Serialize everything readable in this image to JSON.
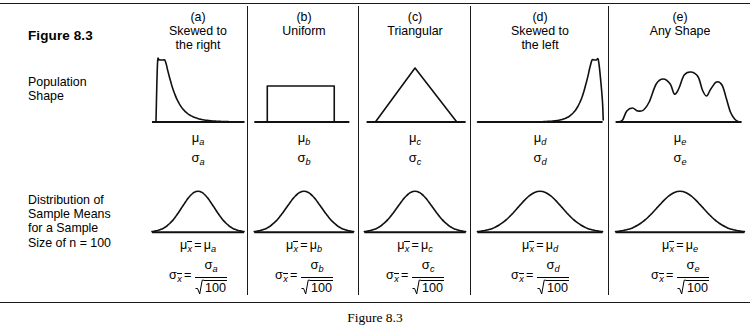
{
  "figure": {
    "header_label": "Figure 8.3",
    "bottom_caption": "Figure 8.3"
  },
  "row_labels": {
    "population": "Population\nShape",
    "sample_means": "Distribution of\nSample Means\nfor a Sample\nSize of n = 100"
  },
  "common": {
    "mu_symbol": "μ",
    "sigma_symbol": "σ",
    "equals": "=",
    "sample_size_radicand": "100",
    "xbar": "x"
  },
  "columns": [
    {
      "key": "a",
      "letter": "(a)",
      "title": "(a)\nSkewed to\nthe right",
      "shape_type": "skewed-right",
      "pop_mu": "μ",
      "pop_mu_sub": "a",
      "pop_sigma": "σ",
      "pop_sigma_sub": "a",
      "mean_formula_sub": "a",
      "sd_numerator_sub": "a",
      "sd_denominator": "100"
    },
    {
      "key": "b",
      "letter": "(b)",
      "title": "(b)\nUniform",
      "shape_type": "uniform",
      "pop_mu": "μ",
      "pop_mu_sub": "b",
      "pop_sigma": "σ",
      "pop_sigma_sub": "b",
      "mean_formula_sub": "b",
      "sd_numerator_sub": "b",
      "sd_denominator": "100"
    },
    {
      "key": "c",
      "letter": "(c)",
      "title": "(c)\nTriangular",
      "shape_type": "triangular",
      "pop_mu": "μ",
      "pop_mu_sub": "c",
      "pop_sigma": "σ",
      "pop_sigma_sub": "c",
      "mean_formula_sub": "c",
      "sd_numerator_sub": "c",
      "sd_denominator": "100"
    },
    {
      "key": "d",
      "letter": "(d)",
      "title": "(d)\nSkewed to\nthe left",
      "shape_type": "skewed-left",
      "pop_mu": "μ",
      "pop_mu_sub": "d",
      "pop_sigma": "σ",
      "pop_sigma_sub": "d",
      "mean_formula_sub": "d",
      "sd_numerator_sub": "d",
      "sd_denominator": "100"
    },
    {
      "key": "e",
      "letter": "(e)",
      "title": "(e)\nAny Shape",
      "shape_type": "multimodal",
      "pop_mu": "μ",
      "pop_mu_sub": "e",
      "pop_sigma": "σ",
      "pop_sigma_sub": "e",
      "mean_formula_sub": "e",
      "sd_numerator_sub": "e",
      "sd_denominator": "100"
    }
  ],
  "chart_data": {
    "type": "line",
    "title": "Figure 8.3",
    "grid": false,
    "legend": false,
    "rows": [
      {
        "name": "Population Shape",
        "curves": [
          {
            "column": "a",
            "shape": "skewed-right"
          },
          {
            "column": "b",
            "shape": "uniform"
          },
          {
            "column": "c",
            "shape": "triangular"
          },
          {
            "column": "d",
            "shape": "skewed-left"
          },
          {
            "column": "e",
            "shape": "multimodal"
          }
        ]
      },
      {
        "name": "Distribution of Sample Means for a Sample Size of n = 100",
        "curves": [
          {
            "column": "a",
            "shape": "normal"
          },
          {
            "column": "b",
            "shape": "normal"
          },
          {
            "column": "c",
            "shape": "normal"
          },
          {
            "column": "d",
            "shape": "normal"
          },
          {
            "column": "e",
            "shape": "normal"
          }
        ]
      }
    ],
    "sample_size": 100
  },
  "layout": {
    "column_lefts": [
      148,
      250,
      360,
      472,
      610
    ],
    "column_widths": [
      100,
      108,
      110,
      136,
      140
    ],
    "divider_xs": [
      247,
      358,
      470,
      608
    ]
  }
}
